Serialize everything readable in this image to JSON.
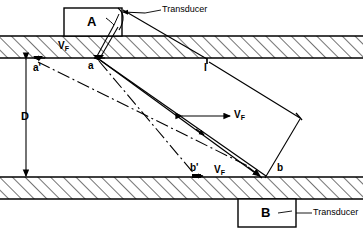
{
  "figure": {
    "colors": {
      "line": "#000000",
      "background": "#ffffff",
      "hatch": "#000000"
    }
  },
  "transducers": [
    {
      "id": "A",
      "label": "A",
      "position": "top"
    },
    {
      "id": "B",
      "label": "B",
      "position": "bottom"
    }
  ],
  "annotations": [
    {
      "id": "transducer-top",
      "text": "Transducer"
    },
    {
      "id": "transducer-bottom",
      "text": "Transducer"
    }
  ],
  "points": [
    {
      "id": "a-prime",
      "label": "a'"
    },
    {
      "id": "a",
      "label": "a"
    },
    {
      "id": "I",
      "label": "I"
    },
    {
      "id": "b-prime",
      "label": "b'"
    },
    {
      "id": "b",
      "label": "b"
    }
  ],
  "dimensions": [
    {
      "id": "D",
      "label": "D",
      "description": "pipe inner diameter"
    }
  ],
  "velocity_labels": [
    {
      "id": "vf-top",
      "symbol": "V",
      "subscript": "F"
    },
    {
      "id": "vf-middle",
      "symbol": "V",
      "subscript": "F"
    },
    {
      "id": "vf-bottom",
      "symbol": "V",
      "subscript": "F"
    }
  ]
}
